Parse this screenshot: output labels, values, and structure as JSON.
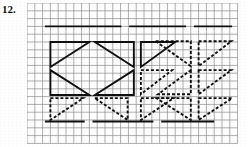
{
  "page": {
    "width": 248,
    "height": 147,
    "background_color": "#ffffff",
    "problem_number": "12."
  },
  "grid": {
    "origin_x": 27,
    "origin_y": 3,
    "cell_size": 7.8,
    "columns": 27,
    "rows": 18,
    "line_color": "#8d8d8d",
    "line_width": 0.7
  },
  "ink": {
    "color": "#111111",
    "solid_width": 1.9,
    "dashed_width": 1.9,
    "dash_pattern": "3,2"
  },
  "chart_data": {
    "type": "scatter",
    "title": "12.",
    "xlabel": "",
    "ylabel": "",
    "units": "grid cells",
    "xlim": [
      0,
      27
    ],
    "ylim": [
      0,
      18
    ],
    "grid": true,
    "legend": "none",
    "reference_lines": [
      {
        "name": "top-reference-line",
        "style": "solid",
        "y": 3.0,
        "segments": [
          {
            "x1": 2.3,
            "x2": 12.1
          },
          {
            "x1": 13.1,
            "x2": 20.4
          },
          {
            "x1": 21.4,
            "x2": 26.3
          }
        ]
      },
      {
        "name": "bottom-reference-line",
        "style": "solid",
        "y": 15.2,
        "segments": [
          {
            "x1": 2.3,
            "x2": 7.4
          },
          {
            "x1": 8.4,
            "x2": 16.2
          },
          {
            "x1": 17.2,
            "x2": 24.0
          }
        ]
      }
    ],
    "triangle_rows": [
      {
        "row": 1,
        "label": "row-1",
        "triangles": [
          {
            "name": "triangle-r1c1",
            "style": "solid",
            "orientation": "right-angle-top-left",
            "points": [
              [
                3.0,
                5.0
              ],
              [
                8.0,
                5.0
              ],
              [
                3.0,
                8.2
              ]
            ]
          },
          {
            "name": "triangle-r1c2",
            "style": "solid",
            "orientation": "right-angle-top-right",
            "points": [
              [
                8.7,
                5.0
              ],
              [
                13.7,
                5.0
              ],
              [
                13.7,
                8.2
              ]
            ]
          },
          {
            "name": "triangle-r1c3",
            "style": "solid",
            "orientation": "right-angle-top-left",
            "points": [
              [
                14.6,
                5.0
              ],
              [
                19.0,
                5.0
              ],
              [
                14.6,
                8.2
              ]
            ]
          },
          {
            "name": "triangle-r1c4",
            "style": "dashed",
            "orientation": "right-angle-top-right",
            "points": [
              [
                16.5,
                4.9
              ],
              [
                21.0,
                4.9
              ],
              [
                21.0,
                8.1
              ]
            ]
          },
          {
            "name": "triangle-r1c5",
            "style": "dashed",
            "orientation": "right-angle-top-left",
            "points": [
              [
                22.0,
                4.9
              ],
              [
                26.2,
                4.9
              ],
              [
                22.0,
                8.1
              ]
            ]
          }
        ]
      },
      {
        "row": 2,
        "label": "row-2",
        "triangles": [
          {
            "name": "triangle-r2c1",
            "style": "solid",
            "orientation": "right-angle-bottom-left",
            "points": [
              [
                3.0,
                8.6
              ],
              [
                3.0,
                11.8
              ],
              [
                8.0,
                11.8
              ]
            ]
          },
          {
            "name": "triangle-r2c2",
            "style": "solid",
            "orientation": "right-angle-bottom-right",
            "points": [
              [
                13.7,
                8.6
              ],
              [
                13.7,
                11.8
              ],
              [
                8.7,
                11.8
              ]
            ]
          },
          {
            "name": "triangle-r2c3",
            "style": "dashed",
            "orientation": "right-angle-top-left",
            "points": [
              [
                14.6,
                8.6
              ],
              [
                18.6,
                8.6
              ],
              [
                14.6,
                11.7
              ]
            ]
          },
          {
            "name": "triangle-r2c4",
            "style": "dashed",
            "orientation": "right-angle-bottom-right",
            "points": [
              [
                21.0,
                8.6
              ],
              [
                21.0,
                11.7
              ],
              [
                16.8,
                11.7
              ]
            ]
          },
          {
            "name": "triangle-r2c5",
            "style": "dashed",
            "orientation": "right-angle-top-left",
            "points": [
              [
                22.0,
                8.6
              ],
              [
                26.2,
                8.6
              ],
              [
                22.0,
                11.7
              ]
            ]
          }
        ]
      },
      {
        "row": 3,
        "label": "row-3",
        "triangles": [
          {
            "name": "triangle-r3c1",
            "style": "dashed",
            "orientation": "right-angle-top-left",
            "points": [
              [
                3.0,
                12.2
              ],
              [
                7.2,
                12.2
              ],
              [
                3.0,
                15.0
              ]
            ]
          },
          {
            "name": "triangle-r3c2",
            "style": "dashed",
            "orientation": "right-angle-top-right",
            "points": [
              [
                8.7,
                12.2
              ],
              [
                12.9,
                12.2
              ],
              [
                12.9,
                15.0
              ]
            ]
          },
          {
            "name": "triangle-r3c3",
            "style": "dashed",
            "orientation": "right-angle-top-left",
            "points": [
              [
                14.6,
                12.2
              ],
              [
                18.8,
                12.2
              ],
              [
                14.6,
                15.0
              ]
            ]
          },
          {
            "name": "triangle-r3c4",
            "style": "dashed",
            "orientation": "right-angle-top-right",
            "points": [
              [
                16.6,
                12.2
              ],
              [
                21.0,
                12.2
              ],
              [
                21.0,
                15.0
              ]
            ]
          },
          {
            "name": "triangle-r3c5",
            "style": "dashed",
            "orientation": "right-angle-top-left",
            "points": [
              [
                22.0,
                12.2
              ],
              [
                26.3,
                12.2
              ],
              [
                22.0,
                15.0
              ]
            ]
          }
        ]
      }
    ]
  }
}
